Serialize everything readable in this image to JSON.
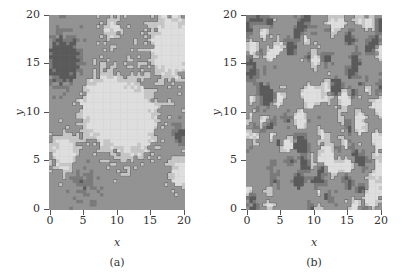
{
  "chart_data": [
    {
      "type": "heatmap",
      "id": "a",
      "caption": "(a)",
      "xlabel": "x",
      "ylabel": "y",
      "xlim": [
        0,
        20
      ],
      "ylim": [
        0,
        20
      ],
      "xticks": [
        0,
        5,
        10,
        15,
        20
      ],
      "yticks": [
        0,
        5,
        10,
        15,
        20
      ],
      "grid": false,
      "colormap": "grayscale with contour lines",
      "description": "Spatially correlated random field on a 20x20 grid: large smooth light blobs (center ~x 5-15, y 6-13; upper right), dark region upper-left (x 0-4, y 13-18), medium gray background, dark contour outlines.",
      "correlation": "long-range (smooth)"
    },
    {
      "type": "heatmap",
      "id": "b",
      "caption": "(b)",
      "xlabel": "x",
      "ylabel": "y",
      "xlim": [
        0,
        20
      ],
      "ylim": [
        0,
        20
      ],
      "xticks": [
        0,
        5,
        10,
        15,
        20
      ],
      "yticks": [
        0,
        5,
        10,
        15,
        20
      ],
      "grid": false,
      "colormap": "grayscale with contour lines",
      "description": "Weakly correlated random field on a 20x20 grid: fine-grained speckled light and dark patches uniformly distributed with many small contour loops.",
      "correlation": "short-range (rough)"
    }
  ],
  "panels": [
    {
      "caption": "(a)",
      "xlabel": "x",
      "ylabel": "y",
      "xticks": [
        "0",
        "5",
        "10",
        "15",
        "20"
      ],
      "yticks": [
        "20",
        "15",
        "10",
        "5",
        "0"
      ]
    },
    {
      "caption": "(b)",
      "xlabel": "x",
      "ylabel": "y",
      "xticks": [
        "0",
        "5",
        "10",
        "15",
        "20"
      ],
      "yticks": [
        "20",
        "15",
        "10",
        "5",
        "0"
      ]
    }
  ],
  "colors": {
    "light": "#dcdcdc",
    "mid": "#8f8f8f",
    "dark": "#555555",
    "contour": "#3a3a3a"
  }
}
